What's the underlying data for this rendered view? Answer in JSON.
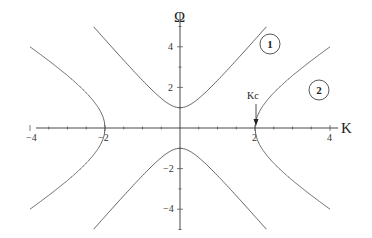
{
  "chart_data": {
    "type": "line",
    "title": "",
    "xlabel": "K",
    "ylabel": "Ω",
    "xlim": [
      -4.8,
      4.2
    ],
    "ylim": [
      -5.8,
      5.9
    ],
    "grid": false,
    "x_ticks": [
      -4,
      -2,
      2,
      4
    ],
    "y_ticks": [
      4,
      2,
      -2,
      -4
    ],
    "x_tick_labels": [
      "−4",
      "−2",
      "2",
      "4"
    ],
    "y_tick_labels": [
      "4",
      "2",
      "−2",
      "−4"
    ],
    "series": [
      {
        "name": "1",
        "description": "gapped branch, Ω = ±sqrt(1 + 4.5 K²), minimum |Ω| = 1 at K = 0",
        "x": [
          -2.3,
          -2,
          -1.5,
          -1,
          -0.5,
          0,
          0.5,
          1,
          1.5,
          2,
          2.3
        ],
        "y_upper": [
          5.0,
          4.36,
          3.34,
          2.35,
          1.46,
          1.0,
          1.46,
          2.35,
          3.34,
          4.36,
          5.0
        ],
        "y_lower": [
          -5.0,
          -4.36,
          -3.34,
          -2.35,
          -1.46,
          -1.0,
          -1.46,
          -2.35,
          -3.34,
          -4.36,
          -5.0
        ]
      },
      {
        "name": "2",
        "description": "branch starting at |K| = Kc = 2, Ω = ±sqrt(1.33 (K² − 4))",
        "x": [
          2,
          2.5,
          3,
          3.5,
          4
        ],
        "y_upper": [
          0,
          1.73,
          2.58,
          3.29,
          4.0
        ],
        "y_lower": [
          0,
          -1.73,
          -2.58,
          -3.29,
          -4.0
        ],
        "mirrored": true
      }
    ],
    "annotations": [
      {
        "text": "Kc",
        "x": 2,
        "y": 0.9,
        "arrow_to": [
          2,
          0
        ]
      },
      {
        "text": "1",
        "style": "circled",
        "x": 2.65,
        "y": 4.1
      },
      {
        "text": "2",
        "style": "circled",
        "x": 3.3,
        "y": 1.6
      }
    ]
  },
  "labels": {
    "x_axis": "K",
    "y_axis": "Ω",
    "kc": "Kc",
    "branch1": "1",
    "branch2": "2",
    "xt_m4": "−4",
    "xt_m2": "−2",
    "xt_2": "2",
    "xt_4": "4",
    "yt_4": "4",
    "yt_2": "2",
    "yt_m2": "−2",
    "yt_m4": "−4"
  }
}
